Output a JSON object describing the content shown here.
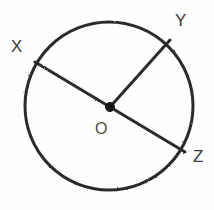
{
  "figure": {
    "kind": "circle-with-radii",
    "canvas": {
      "width": 214,
      "height": 210,
      "background": "#fefefe"
    },
    "stroke_color": "#2b2b2b",
    "label_color": "#3a3a3a",
    "circle": {
      "center_x": 109,
      "center_y": 106,
      "radius": 84,
      "stroke_width": 3
    },
    "center_point": {
      "label": "O",
      "x": 110,
      "y": 107,
      "dot_radius": 4.5,
      "fill": "#151515"
    },
    "points": [
      {
        "id": "X",
        "label": "X",
        "x": 35,
        "y": 62,
        "label_x": 11,
        "label_y": 38
      },
      {
        "id": "Y",
        "label": "Y",
        "x": 170,
        "y": 40,
        "label_x": 175,
        "label_y": 12
      },
      {
        "id": "Z",
        "label": "Z",
        "x": 185,
        "y": 152,
        "label_x": 193,
        "label_y": 148
      }
    ],
    "segments": [
      {
        "id": "OX",
        "from": "O",
        "to": "X",
        "type": "radius"
      },
      {
        "id": "OY",
        "from": "O",
        "to": "Y",
        "type": "radius"
      },
      {
        "id": "OZ",
        "from": "O",
        "to": "Z",
        "type": "radius"
      }
    ],
    "diameter_note": "X and Z are collinear through O forming diameter XZ"
  }
}
